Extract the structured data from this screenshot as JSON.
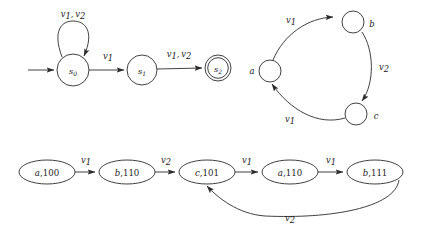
{
  "figure": {
    "background_color": "#ffffff",
    "ink_color": "#2b2b2b",
    "panels": [
      {
        "name": "automaton",
        "states": [
          {
            "id": "s0",
            "label_base": "s",
            "label_sub": "0",
            "cx": 73,
            "cy": 70,
            "r": 16,
            "accepting": false
          },
          {
            "id": "s1",
            "label_base": "s",
            "label_sub": "1",
            "cx": 142,
            "cy": 70,
            "r": 15,
            "accepting": false
          },
          {
            "id": "s2",
            "label_base": "s",
            "label_sub": "2",
            "cx": 218,
            "cy": 68,
            "r": 13,
            "accepting": true
          }
        ],
        "transitions": [
          {
            "from": "start",
            "to": "s0",
            "label": ""
          },
          {
            "from": "s0",
            "to": "s0",
            "label_parts": [
              "v",
              "1",
              ", ",
              "v",
              "2"
            ],
            "label_text": "v1, v2",
            "label_x": 73,
            "label_y": 17
          },
          {
            "from": "s0",
            "to": "s1",
            "label_parts": [
              "v",
              "1"
            ],
            "label_text": "v1",
            "label_x": 108,
            "label_y": 59
          },
          {
            "from": "s1",
            "to": "s2",
            "label_parts": [
              "v",
              "1",
              ", ",
              "v",
              "2"
            ],
            "label_text": "v1, v2",
            "label_x": 178,
            "label_y": 57
          }
        ]
      },
      {
        "name": "cycle-graph",
        "nodes": [
          {
            "id": "a",
            "label": "a",
            "cx": 270,
            "cy": 71,
            "r": 11,
            "label_x": 252,
            "label_y": 74
          },
          {
            "id": "b",
            "label": "b",
            "cx": 353,
            "cy": 22,
            "r": 11,
            "label_x": 372,
            "label_y": 27
          },
          {
            "id": "c",
            "label": "c",
            "cx": 356,
            "cy": 114,
            "r": 11,
            "label_x": 376,
            "label_y": 119
          }
        ],
        "edges": [
          {
            "from": "a",
            "to": "b",
            "label_parts": [
              "v",
              "1"
            ],
            "label_text": "v1",
            "label_x": 291,
            "label_y": 22
          },
          {
            "from": "b",
            "to": "c",
            "label_parts": [
              "v",
              "2"
            ],
            "label_text": "v2",
            "label_x": 384,
            "label_y": 70
          },
          {
            "from": "c",
            "to": "a",
            "label_parts": [
              "v",
              "1"
            ],
            "label_text": "v1",
            "label_x": 290,
            "label_y": 122
          }
        ]
      },
      {
        "name": "product-chain",
        "states": [
          {
            "id": "n1",
            "name": "a",
            "bits": "100",
            "text": "a,100",
            "cx": 47,
            "cy": 172,
            "rx": 28,
            "ry": 12
          },
          {
            "id": "n2",
            "name": "b",
            "bits": "110",
            "text": "b,110",
            "cx": 127,
            "cy": 172,
            "rx": 28,
            "ry": 12
          },
          {
            "id": "n3",
            "name": "c",
            "bits": "101",
            "text": "c,101",
            "cx": 207,
            "cy": 172,
            "rx": 28,
            "ry": 12
          },
          {
            "id": "n4",
            "name": "a",
            "bits": "110",
            "text": "a,110",
            "cx": 290,
            "cy": 172,
            "rx": 28,
            "ry": 12
          },
          {
            "id": "n5",
            "name": "b",
            "bits": "111",
            "text": "b,111",
            "cx": 375,
            "cy": 172,
            "rx": 28,
            "ry": 12
          }
        ],
        "edges": [
          {
            "from": "n1",
            "to": "n2",
            "label_parts": [
              "v",
              "1"
            ],
            "label_text": "v1",
            "label_x": 86,
            "label_y": 162
          },
          {
            "from": "n2",
            "to": "n3",
            "label_parts": [
              "v",
              "2"
            ],
            "label_text": "v2",
            "label_x": 166,
            "label_y": 162
          },
          {
            "from": "n3",
            "to": "n4",
            "label_parts": [
              "v",
              "1"
            ],
            "label_text": "v1",
            "label_x": 247,
            "label_y": 162
          },
          {
            "from": "n4",
            "to": "n5",
            "label_parts": [
              "v",
              "1"
            ],
            "label_text": "v1",
            "label_x": 331,
            "label_y": 162
          },
          {
            "from": "n5",
            "to": "n3",
            "label_parts": [
              "v",
              "2"
            ],
            "label_text": "v2",
            "label_x": 290,
            "label_y": 220,
            "kind": "back-edge"
          }
        ]
      }
    ]
  }
}
